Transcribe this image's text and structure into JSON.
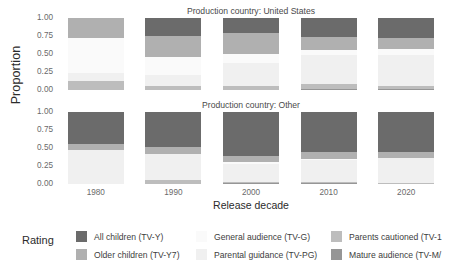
{
  "chart_data": {
    "type": "bar",
    "subtype": "stacked-proportional-faceted",
    "title": "",
    "xlabel": "Release decade",
    "ylabel": "Proportion",
    "ylim": [
      0,
      1
    ],
    "ytick_labels": [
      "1.00",
      "0.75",
      "0.50",
      "0.25",
      "0.00"
    ],
    "ytick_values": [
      1.0,
      0.75,
      0.5,
      0.25,
      0.0
    ],
    "grid": false,
    "legend_title": "Rating",
    "legend_position": "bottom",
    "categories": [
      "1980",
      "1990",
      "2000",
      "2010",
      "2020"
    ],
    "facets": [
      {
        "name": "united-states",
        "strip_label": "Production country: United States",
        "bars": [
          {
            "category": "1980",
            "values": [
              0.0,
              0.12,
              0.12,
              0.48,
              0.28,
              0.0
            ]
          },
          {
            "category": "1990",
            "values": [
              0.0,
              0.05,
              0.16,
              0.25,
              0.29,
              0.25
            ]
          },
          {
            "category": "2000",
            "values": [
              0.0,
              0.06,
              0.31,
              0.13,
              0.29,
              0.21
            ]
          },
          {
            "category": "2010",
            "values": [
              0.02,
              0.06,
              0.4,
              0.07,
              0.18,
              0.27
            ]
          },
          {
            "category": "2020",
            "values": [
              0.01,
              0.04,
              0.44,
              0.08,
              0.15,
              0.28
            ]
          }
        ]
      },
      {
        "name": "other",
        "strip_label": "Production country: Other",
        "bars": [
          {
            "category": "1980",
            "values": [
              0.0,
              0.0,
              0.47,
              0.0,
              0.08,
              0.45
            ]
          },
          {
            "category": "1990",
            "values": [
              0.0,
              0.06,
              0.36,
              0.0,
              0.1,
              0.48
            ]
          },
          {
            "category": "2000",
            "values": [
              0.01,
              0.02,
              0.25,
              0.03,
              0.08,
              0.61
            ]
          },
          {
            "category": "2010",
            "values": [
              0.01,
              0.02,
              0.3,
              0.02,
              0.09,
              0.56
            ]
          },
          {
            "category": "2020",
            "values": [
              0.0,
              0.01,
              0.35,
              0.0,
              0.08,
              0.56
            ]
          }
        ]
      }
    ],
    "series": [
      {
        "key": "tv-ma",
        "name": "Mature audience (TV-MA)",
        "color": "#969696"
      },
      {
        "key": "tv-14",
        "name": "Parents cautioned (TV-14)",
        "color": "#bdbdbd"
      },
      {
        "key": "tv-pg",
        "name": "Parental guidance (TV-PG)",
        "color": "#f0f0f0"
      },
      {
        "key": "tv-g",
        "name": "General audience (TV-G)",
        "color": "#fafafa"
      },
      {
        "key": "tv-y7",
        "name": "Older children (TV-Y7)",
        "color": "#b0b0b0"
      },
      {
        "key": "tv-y",
        "name": "All children (TV-Y)",
        "color": "#6b6b6b"
      }
    ]
  },
  "legend": {
    "title": "Rating",
    "columns": [
      [
        {
          "label": "All children (TV-Y)",
          "color": "#6b6b6b"
        },
        {
          "label": "Older children (TV-Y7)",
          "color": "#b0b0b0"
        }
      ],
      [
        {
          "label": "General audience (TV-G)",
          "color": "#fafafa"
        },
        {
          "label": "Parental guidance (TV-PG)",
          "color": "#f0f0f0"
        }
      ],
      [
        {
          "label": "Parents cautioned (TV-1",
          "color": "#bdbdbd"
        },
        {
          "label": "Mature audience (TV-M/",
          "color": "#969696"
        }
      ]
    ]
  },
  "axes": {
    "y_title": "Proportion",
    "x_title": "Release decade",
    "y_ticks": [
      "1.00",
      "0.75",
      "0.50",
      "0.25",
      "0.00"
    ],
    "x_ticks": [
      "1980",
      "1990",
      "2000",
      "2010",
      "2020"
    ]
  },
  "facet_strips": {
    "top": "Production country: United States",
    "bottom": "Production country: Other"
  }
}
